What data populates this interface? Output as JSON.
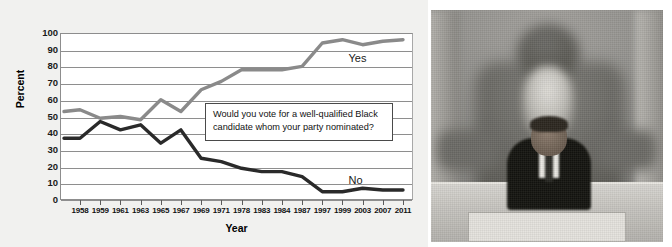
{
  "chart_data": {
    "type": "line",
    "title": "",
    "xlabel": "Year",
    "ylabel": "Percent",
    "ylim": [
      0,
      100
    ],
    "ytick_step": 10,
    "yticks": [
      100,
      90,
      80,
      70,
      60,
      50,
      40,
      30,
      20,
      10,
      0
    ],
    "grid": true,
    "legend_position": "inline-right-of-lines",
    "categories": [
      "1958",
      "1959",
      "1961",
      "1963",
      "1965",
      "1967",
      "1969",
      "1971",
      "1978",
      "1983",
      "1984",
      "1987",
      "1997",
      "1999",
      "2003",
      "2007",
      "2011"
    ],
    "annotation": "Would you vote for a well-qualified Black candidate whom your party nominated?",
    "series": [
      {
        "name": "Yes",
        "color": "#8a8a8a",
        "values": [
          54,
          49,
          50,
          48,
          60,
          53,
          66,
          71,
          78,
          78,
          78,
          80,
          94,
          96,
          93,
          95,
          96
        ]
      },
      {
        "name": "No",
        "color": "#2a2a2a",
        "values": [
          37,
          47,
          42,
          45,
          34,
          42,
          25,
          23,
          19,
          17,
          17,
          14,
          5,
          5,
          7,
          6,
          6
        ]
      }
    ],
    "lead_in": {
      "note": "both lines begin slightly left of the 1958 tick",
      "yes_start": 53,
      "no_start": 37
    }
  },
  "axes": {
    "y_title": "Percent",
    "x_title": "Year"
  },
  "photo": {
    "alt_name": "obama-lincoln-memorial-photo",
    "caption": ""
  },
  "colors": {
    "panel_background": "#f1f1ef",
    "plot_background": "#ffffff",
    "gridline": "#8e8e8e",
    "yes_line": "#8a8a8a",
    "no_line": "#2a2a2a",
    "callout_border": "#4a4a4a",
    "text": "#111111"
  }
}
